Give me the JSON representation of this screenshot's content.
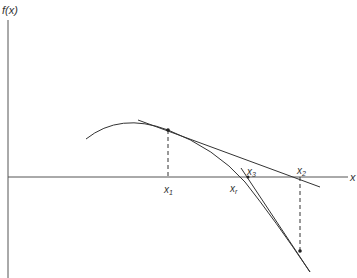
{
  "diagram": {
    "y_axis_label": "f(x)",
    "x_axis_label": "x",
    "points": {
      "x1": {
        "label": "x",
        "sub": "1"
      },
      "x2": {
        "label": "x",
        "sub": "2"
      },
      "x3": {
        "label": "x",
        "sub": "3"
      },
      "xr": {
        "label": "x",
        "sub": "r"
      }
    },
    "colors": {
      "line": "#333333",
      "axis": "#555555",
      "background": "#ffffff"
    }
  }
}
